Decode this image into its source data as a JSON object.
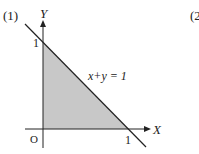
{
  "problem_labels": {
    "part1": "(1)",
    "part2_partial": "(2"
  },
  "axes": {
    "x_label": "X",
    "y_label": "Y",
    "origin_label": "O"
  },
  "intercepts": {
    "x_tick_label": "1",
    "y_tick_label": "1"
  },
  "equation": {
    "text": "x+y = 1"
  },
  "colors": {
    "shade": "#c8c8c8",
    "line": "#222222"
  }
}
